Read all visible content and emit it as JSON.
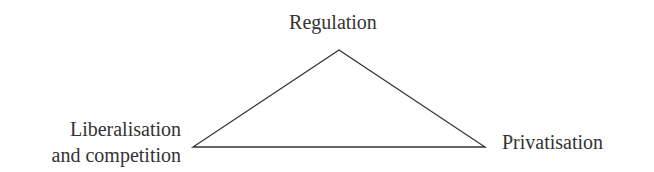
{
  "diagram": {
    "type": "triangle",
    "nodes": {
      "top": {
        "label": "Regulation"
      },
      "left": {
        "label_line1": "Liberalisation",
        "label_line2": "and competition"
      },
      "right": {
        "label": "Privatisation"
      }
    },
    "vertices": {
      "top": [
        339,
        50
      ],
      "left": [
        193,
        147
      ],
      "right": [
        485,
        147
      ]
    },
    "stroke_color": "#333333",
    "text_color": "#333333",
    "background": "#ffffff"
  }
}
